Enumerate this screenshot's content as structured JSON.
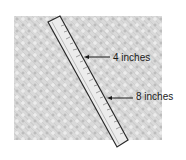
{
  "figure": {
    "labels": [
      {
        "text": "4 inches",
        "points_to": "ruler-4-inch-mark"
      },
      {
        "text": "8 inches",
        "points_to": "ruler-8-inch-mark"
      }
    ],
    "colors": {
      "surface": "#d9d9d9",
      "ruler_fill": "#ececec",
      "ruler_outline": "#2a2a2a",
      "text": "#1a1a1a"
    }
  }
}
